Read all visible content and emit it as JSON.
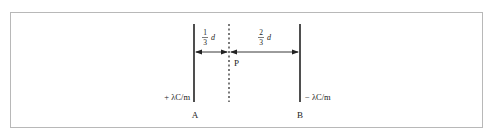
{
  "diagram": {
    "plate_a": {
      "label": "A",
      "charge": "+ λC/m"
    },
    "plate_b": {
      "label": "B",
      "charge": "− λC/m"
    },
    "point": {
      "label": "P"
    },
    "left_gap": {
      "num": "1",
      "den": "3",
      "var": "d"
    },
    "right_gap": {
      "num": "2",
      "den": "3",
      "var": "d"
    },
    "colors": {
      "line": "#222222",
      "border": "#b8b8b8"
    }
  }
}
